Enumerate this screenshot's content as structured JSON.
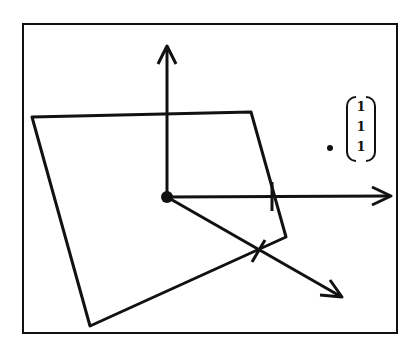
{
  "diagram": {
    "frame": {
      "x": 23,
      "y": 24,
      "width": 374,
      "height": 309
    },
    "origin": {
      "x": 167,
      "y": 197
    },
    "axes": [
      {
        "name": "up",
        "to": {
          "x": 167,
          "y": 48
        }
      },
      {
        "name": "right",
        "to": {
          "x": 390,
          "y": 196
        }
      },
      {
        "name": "diagonal",
        "to": {
          "x": 342,
          "y": 297
        }
      }
    ],
    "plane_polygon": [
      [
        32,
        117
      ],
      [
        251,
        112
      ],
      [
        286,
        237
      ],
      [
        90,
        326
      ]
    ],
    "point": {
      "x": 330,
      "y": 148
    },
    "vector_label": [
      "1",
      "1",
      "1"
    ],
    "stroke_color": "#111111"
  }
}
